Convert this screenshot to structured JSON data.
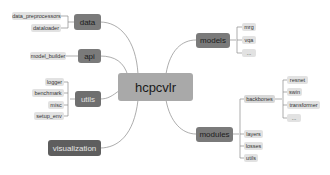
{
  "root": {
    "label": "hcpcvlr"
  },
  "left_branches": [
    {
      "label": "data",
      "children": [
        "data_preprocessors",
        "dataloader"
      ]
    },
    {
      "label": "api",
      "children": [
        "model_builder"
      ]
    },
    {
      "label": "utils",
      "children": [
        "logger",
        "benchmark",
        "misc",
        "setup_env"
      ]
    },
    {
      "label": "visualization",
      "children": []
    }
  ],
  "right_branches": [
    {
      "label": "models",
      "children": [
        "mrg",
        "vqa",
        "..."
      ]
    },
    {
      "label": "modules",
      "children": [
        {
          "label": "backbones",
          "children": [
            "resnet",
            "swin",
            "transformer",
            "..."
          ]
        },
        {
          "label": "layers"
        },
        {
          "label": "losses"
        },
        {
          "label": "utils"
        }
      ]
    }
  ],
  "colors": {
    "root": "#a9a9a9",
    "branch": "#7a7a7a",
    "branch_dark": "#5e5e5e",
    "leaf": "#e2e2e2",
    "link": "#8a8a8a"
  }
}
